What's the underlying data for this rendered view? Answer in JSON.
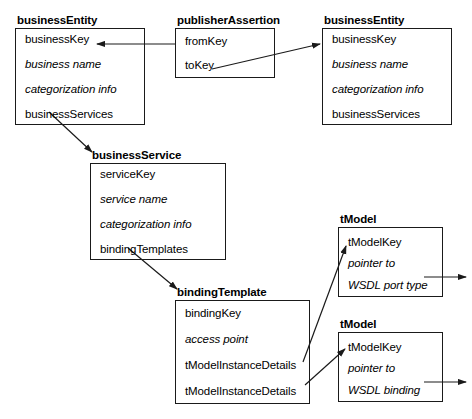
{
  "diagram": {
    "stroke_color": "#1a1a1a",
    "background_color": "#ffffff",
    "nodes": [
      {
        "id": "business-entity-left",
        "title": "businessEntity",
        "fields": [
          {
            "text": "businessKey",
            "style": "normal"
          },
          {
            "text": "business name",
            "style": "italic"
          },
          {
            "text": "categorization info",
            "style": "italic"
          },
          {
            "text": "businessServices",
            "style": "normal"
          }
        ]
      },
      {
        "id": "publisher-assertion",
        "title": "publisherAssertion",
        "fields": [
          {
            "text": "fromKey",
            "style": "normal"
          },
          {
            "text": "toKey",
            "style": "normal"
          }
        ]
      },
      {
        "id": "business-entity-right",
        "title": "businessEntity",
        "fields": [
          {
            "text": "businessKey",
            "style": "normal"
          },
          {
            "text": "business name",
            "style": "italic"
          },
          {
            "text": "categorization info",
            "style": "italic"
          },
          {
            "text": "businessServices",
            "style": "normal"
          }
        ]
      },
      {
        "id": "business-service",
        "title": "businessService",
        "fields": [
          {
            "text": "serviceKey",
            "style": "normal"
          },
          {
            "text": "service name",
            "style": "italic"
          },
          {
            "text": "categorization info",
            "style": "italic"
          },
          {
            "text": "bindingTemplates",
            "style": "normal"
          }
        ]
      },
      {
        "id": "binding-template",
        "title": "bindingTemplate",
        "fields": [
          {
            "text": "bindingKey",
            "style": "normal"
          },
          {
            "text": "access point",
            "style": "italic"
          },
          {
            "text": "tModelInstanceDetails",
            "style": "normal"
          },
          {
            "text": "tModelInstanceDetails",
            "style": "normal"
          }
        ]
      },
      {
        "id": "tmodel-port-type",
        "title": "tModel",
        "fields": [
          {
            "text": "tModelKey",
            "style": "normal"
          },
          {
            "text": "pointer to",
            "style": "italic"
          },
          {
            "text": "WSDL port type",
            "style": "italic"
          }
        ]
      },
      {
        "id": "tmodel-binding",
        "title": "tModel",
        "fields": [
          {
            "text": "tModelKey",
            "style": "normal"
          },
          {
            "text": "pointer to",
            "style": "italic"
          },
          {
            "text": "WSDL binding",
            "style": "italic"
          }
        ]
      }
    ],
    "connections": [
      {
        "id": "fromkey-to-left-businesskey",
        "from": "publisherAssertion.fromKey",
        "to": "businessEntity(left).businessKey"
      },
      {
        "id": "tokey-to-right-businesskey",
        "from": "publisherAssertion.toKey",
        "to": "businessEntity(right).businessKey"
      },
      {
        "id": "businessservices-to-businessservice",
        "from": "businessEntity(left).businessServices",
        "to": "businessService"
      },
      {
        "id": "bindingtemplates-to-bindingtemplate",
        "from": "businessService.bindingTemplates",
        "to": "bindingTemplate"
      },
      {
        "id": "tmodelinstancedetails-1-to-tmodel-port-type",
        "from": "bindingTemplate.tModelInstanceDetails",
        "to": "tModel(port type).tModelKey"
      },
      {
        "id": "tmodelinstancedetails-2-to-tmodel-binding",
        "from": "bindingTemplate.tModelInstanceDetails",
        "to": "tModel(binding).tModelKey"
      },
      {
        "id": "tmodel-port-type-outbound",
        "from": "tModel(port type).WSDL port type",
        "to": "external"
      },
      {
        "id": "tmodel-binding-outbound",
        "from": "tModel(binding).WSDL binding",
        "to": "external"
      }
    ]
  }
}
